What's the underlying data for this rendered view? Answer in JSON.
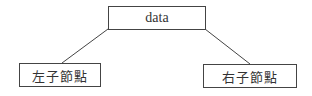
{
  "diagram": {
    "type": "binary-tree-node",
    "root": {
      "label": "data"
    },
    "children": [
      {
        "label": "左子節點",
        "position": "left"
      },
      {
        "label": "右子節點",
        "position": "right"
      }
    ],
    "edges": [
      {
        "from": "data",
        "to": "左子節點"
      },
      {
        "from": "data",
        "to": "右子節點"
      }
    ],
    "colors": {
      "stroke": "#444444",
      "text": "#333333",
      "background": "#ffffff"
    }
  }
}
